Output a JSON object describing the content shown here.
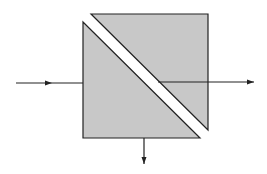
{
  "diagram": {
    "title": "",
    "type": "beam-splitter-cube",
    "colors": {
      "background": "#ffffff",
      "prism_fill": "#c8c8c8",
      "stroke": "#222222",
      "gap": "#ffffff"
    },
    "prisms": [
      {
        "name": "lower-left-prism",
        "points": [
          [
            83,
            22
          ],
          [
            83,
            138
          ],
          [
            200,
            138
          ]
        ]
      },
      {
        "name": "upper-right-prism",
        "points": [
          [
            91,
            14
          ],
          [
            208,
            14
          ],
          [
            208,
            130
          ]
        ]
      }
    ],
    "beams": [
      {
        "name": "input-beam",
        "from": [
          16,
          83
        ],
        "to": [
          83,
          83
        ],
        "arrow_at": [
          52,
          83
        ],
        "direction": "right"
      },
      {
        "name": "transmitted-beam",
        "from": [
          158,
          82
        ],
        "to": [
          254,
          82
        ],
        "arrow_at": [
          254,
          82
        ],
        "direction": "right"
      },
      {
        "name": "reflected-beam",
        "from": [
          144,
          138
        ],
        "to": [
          144,
          164
        ],
        "arrow_at": [
          144,
          164
        ],
        "direction": "down"
      }
    ],
    "labels": []
  }
}
